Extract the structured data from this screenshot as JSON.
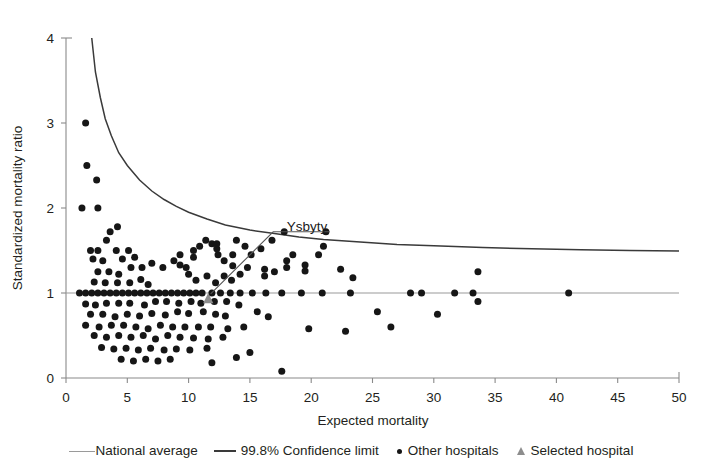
{
  "chart_data": {
    "type": "scatter",
    "title": "",
    "xlabel": "Expected mortality",
    "ylabel": "Standardized mortality ratio",
    "xlim": [
      0,
      50
    ],
    "ylim": [
      0,
      4
    ],
    "xticks": [
      0,
      5,
      10,
      15,
      20,
      25,
      30,
      35,
      40,
      45,
      50
    ],
    "yticks": [
      0,
      1,
      2,
      3,
      4
    ],
    "grid": false,
    "legend_position": "bottom",
    "reference_lines": [
      {
        "name": "National average",
        "type": "horizontal",
        "value": 1,
        "color": "#9a9a9a"
      }
    ],
    "confidence_limit": {
      "name": "99.8% Confidence limit",
      "level": "99.8%",
      "color": "#3a3a3a",
      "x_start": 2.1,
      "y_start": 4.0,
      "x_end": 50,
      "y_end": 1.5,
      "points": [
        [
          2.1,
          4.0
        ],
        [
          2.4,
          3.6
        ],
        [
          2.8,
          3.3
        ],
        [
          3.2,
          3.05
        ],
        [
          3.7,
          2.85
        ],
        [
          4.3,
          2.65
        ],
        [
          5.0,
          2.5
        ],
        [
          6.0,
          2.33
        ],
        [
          7.0,
          2.2
        ],
        [
          8.0,
          2.1
        ],
        [
          9.0,
          2.02
        ],
        [
          10.0,
          1.95
        ],
        [
          11.5,
          1.87
        ],
        [
          13.0,
          1.8
        ],
        [
          15.0,
          1.74
        ],
        [
          17.0,
          1.7
        ],
        [
          19.0,
          1.66
        ],
        [
          21.0,
          1.63
        ],
        [
          24.0,
          1.6
        ],
        [
          27.0,
          1.57
        ],
        [
          30.0,
          1.555
        ],
        [
          34.0,
          1.535
        ],
        [
          38.0,
          1.52
        ],
        [
          42.0,
          1.51
        ],
        [
          46.0,
          1.5
        ],
        [
          50.0,
          1.495
        ]
      ]
    },
    "annotation": {
      "text": "Ysbyty",
      "label_x": 18.0,
      "label_y": 1.79,
      "target_x": 11.6,
      "target_y": 0.93,
      "leader_points": [
        [
          21.5,
          1.72
        ],
        [
          16.9,
          1.72
        ],
        [
          11.8,
          0.99
        ]
      ]
    },
    "series": [
      {
        "name": "Selected hospital",
        "marker": "triangle",
        "color": "#8d8d8d",
        "points": [
          [
            11.6,
            0.93
          ]
        ]
      },
      {
        "name": "Other hospitals",
        "marker": "circle",
        "color": "#161616",
        "points": [
          [
            1.3,
            2.0
          ],
          [
            1.6,
            3.0
          ],
          [
            1.7,
            2.5
          ],
          [
            2.5,
            2.33
          ],
          [
            2.6,
            2.0
          ],
          [
            3.6,
            1.72
          ],
          [
            4.2,
            1.78
          ],
          [
            3.3,
            1.62
          ],
          [
            2.0,
            1.5
          ],
          [
            2.6,
            1.5
          ],
          [
            4.1,
            1.5
          ],
          [
            5.1,
            1.5
          ],
          [
            2.2,
            1.4
          ],
          [
            3.0,
            1.38
          ],
          [
            4.6,
            1.4
          ],
          [
            5.6,
            1.42
          ],
          [
            2.6,
            1.25
          ],
          [
            3.5,
            1.25
          ],
          [
            4.3,
            1.22
          ],
          [
            5.3,
            1.3
          ],
          [
            6.2,
            1.3
          ],
          [
            2.3,
            1.13
          ],
          [
            3.2,
            1.12
          ],
          [
            4.2,
            1.12
          ],
          [
            5.2,
            1.12
          ],
          [
            6.1,
            1.16
          ],
          [
            6.7,
            1.1
          ],
          [
            1.1,
            1.0
          ],
          [
            1.6,
            1.0
          ],
          [
            2.1,
            1.0
          ],
          [
            2.6,
            1.0
          ],
          [
            3.1,
            1.0
          ],
          [
            3.6,
            1.0
          ],
          [
            4.1,
            1.0
          ],
          [
            4.6,
            1.0
          ],
          [
            5.1,
            1.0
          ],
          [
            5.6,
            1.0
          ],
          [
            6.1,
            1.0
          ],
          [
            6.6,
            1.0
          ],
          [
            7.1,
            1.0
          ],
          [
            7.6,
            1.0
          ],
          [
            8.1,
            1.0
          ],
          [
            8.6,
            1.0
          ],
          [
            9.1,
            1.0
          ],
          [
            9.6,
            1.0
          ],
          [
            10.1,
            1.0
          ],
          [
            10.6,
            1.0
          ],
          [
            11.1,
            1.0
          ],
          [
            11.9,
            1.0
          ],
          [
            12.6,
            1.0
          ],
          [
            13.4,
            1.0
          ],
          [
            14.2,
            1.0
          ],
          [
            15.2,
            1.0
          ],
          [
            16.3,
            1.0
          ],
          [
            17.6,
            1.0
          ],
          [
            19.2,
            1.0
          ],
          [
            20.9,
            1.0
          ],
          [
            23.2,
            1.0
          ],
          [
            28.1,
            1.0
          ],
          [
            29.0,
            1.0
          ],
          [
            31.7,
            1.0
          ],
          [
            33.2,
            1.0
          ],
          [
            41.0,
            1.0
          ],
          [
            1.6,
            0.87
          ],
          [
            2.4,
            0.86
          ],
          [
            3.3,
            0.88
          ],
          [
            4.3,
            0.88
          ],
          [
            5.2,
            0.88
          ],
          [
            6.4,
            0.86
          ],
          [
            7.3,
            0.9
          ],
          [
            8.2,
            0.9
          ],
          [
            9.2,
            0.88
          ],
          [
            10.2,
            0.9
          ],
          [
            11.0,
            0.88
          ],
          [
            12.1,
            0.9
          ],
          [
            13.1,
            0.9
          ],
          [
            14.1,
            0.86
          ],
          [
            2.0,
            0.75
          ],
          [
            3.0,
            0.75
          ],
          [
            4.0,
            0.72
          ],
          [
            5.0,
            0.75
          ],
          [
            6.0,
            0.73
          ],
          [
            7.0,
            0.76
          ],
          [
            8.1,
            0.74
          ],
          [
            9.1,
            0.78
          ],
          [
            10.0,
            0.76
          ],
          [
            11.2,
            0.78
          ],
          [
            12.2,
            0.75
          ],
          [
            13.0,
            0.73
          ],
          [
            15.6,
            0.78
          ],
          [
            16.5,
            0.72
          ],
          [
            1.6,
            0.62
          ],
          [
            2.7,
            0.6
          ],
          [
            3.7,
            0.62
          ],
          [
            4.7,
            0.62
          ],
          [
            5.7,
            0.6
          ],
          [
            6.7,
            0.58
          ],
          [
            7.7,
            0.62
          ],
          [
            8.7,
            0.6
          ],
          [
            9.7,
            0.6
          ],
          [
            10.8,
            0.6
          ],
          [
            11.8,
            0.6
          ],
          [
            13.2,
            0.58
          ],
          [
            14.5,
            0.6
          ],
          [
            2.3,
            0.5
          ],
          [
            3.3,
            0.48
          ],
          [
            4.3,
            0.5
          ],
          [
            5.3,
            0.48
          ],
          [
            6.3,
            0.5
          ],
          [
            7.3,
            0.46
          ],
          [
            8.3,
            0.5
          ],
          [
            9.3,
            0.48
          ],
          [
            10.4,
            0.47
          ],
          [
            11.6,
            0.46
          ],
          [
            12.8,
            0.48
          ],
          [
            2.9,
            0.36
          ],
          [
            3.9,
            0.34
          ],
          [
            4.9,
            0.35
          ],
          [
            5.9,
            0.33
          ],
          [
            6.9,
            0.35
          ],
          [
            8.0,
            0.33
          ],
          [
            9.0,
            0.34
          ],
          [
            10.1,
            0.33
          ],
          [
            11.5,
            0.35
          ],
          [
            4.5,
            0.22
          ],
          [
            5.5,
            0.2
          ],
          [
            6.5,
            0.22
          ],
          [
            7.5,
            0.2
          ],
          [
            8.5,
            0.22
          ],
          [
            11.9,
            0.18
          ],
          [
            7.0,
            1.35
          ],
          [
            7.9,
            1.3
          ],
          [
            8.8,
            1.38
          ],
          [
            9.3,
            1.45
          ],
          [
            9.3,
            1.33
          ],
          [
            9.8,
            1.3
          ],
          [
            10.4,
            1.42
          ],
          [
            10.4,
            1.5
          ],
          [
            10.9,
            1.55
          ],
          [
            11.4,
            1.62
          ],
          [
            11.9,
            1.58
          ],
          [
            12.4,
            1.45
          ],
          [
            12.9,
            1.38
          ],
          [
            10.0,
            1.22
          ],
          [
            10.6,
            1.15
          ],
          [
            11.5,
            1.2
          ],
          [
            12.2,
            1.12
          ],
          [
            12.9,
            1.2
          ],
          [
            13.5,
            1.15
          ],
          [
            13.6,
            1.32
          ],
          [
            13.6,
            1.45
          ],
          [
            14.2,
            1.22
          ],
          [
            14.8,
            1.3
          ],
          [
            15.1,
            1.45
          ],
          [
            15.9,
            1.52
          ],
          [
            16.8,
            1.62
          ],
          [
            17.8,
            1.72
          ],
          [
            21.2,
            1.72
          ],
          [
            13.9,
            1.62
          ],
          [
            14.6,
            1.55
          ],
          [
            18.0,
            1.3
          ],
          [
            18.0,
            1.38
          ],
          [
            18.5,
            1.45
          ],
          [
            19.5,
            1.26
          ],
          [
            19.5,
            1.33
          ],
          [
            20.6,
            1.45
          ],
          [
            21.0,
            1.55
          ],
          [
            22.4,
            1.28
          ],
          [
            23.4,
            1.18
          ],
          [
            12.3,
            1.52
          ],
          [
            12.3,
            1.58
          ],
          [
            16.2,
            1.28
          ],
          [
            16.2,
            1.2
          ],
          [
            17.0,
            1.25
          ],
          [
            25.4,
            0.78
          ],
          [
            26.5,
            0.6
          ],
          [
            33.6,
            1.25
          ],
          [
            33.6,
            0.9
          ],
          [
            30.3,
            0.75
          ],
          [
            19.8,
            0.58
          ],
          [
            22.8,
            0.55
          ],
          [
            15.0,
            0.3
          ],
          [
            13.9,
            0.24
          ],
          [
            17.6,
            0.08
          ]
        ]
      }
    ]
  },
  "legend": {
    "items": [
      {
        "label": "National average",
        "glyph": "line-light-icon"
      },
      {
        "label": "99.8% Confidence limit",
        "glyph": "line-dark-icon"
      },
      {
        "label": "Other hospitals",
        "glyph": "dot-icon"
      },
      {
        "label": "Selected hospital",
        "glyph": "triangle-icon"
      }
    ]
  },
  "axis": {
    "x_title": "Expected mortality",
    "y_title": "Standardized mortality ratio",
    "x_tick_labels": [
      "0",
      "5",
      "10",
      "15",
      "20",
      "25",
      "30",
      "35",
      "40",
      "45",
      "50"
    ],
    "y_tick_labels": [
      "0",
      "1",
      "2",
      "3",
      "4"
    ]
  }
}
